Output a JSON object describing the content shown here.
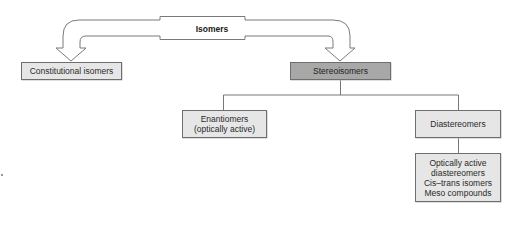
{
  "diagram": {
    "type": "hierarchy",
    "root": {
      "label": "Isomers"
    },
    "nodes": {
      "constitutional": {
        "label": "Constitutional isomers"
      },
      "stereoisomers": {
        "label": "Stereoisomers"
      },
      "enantiomers": {
        "lines": [
          "Enantiomers",
          "(optically active)"
        ]
      },
      "diastereomers": {
        "label": "Diastereomers"
      },
      "diastereomer_types": {
        "lines": [
          "Optically active",
          "diastereomers",
          "Cis–trans isomers",
          "Meso compounds"
        ]
      }
    },
    "edges": [
      {
        "from": "Isomers",
        "to": "Constitutional isomers",
        "style": "hollow-arrow"
      },
      {
        "from": "Isomers",
        "to": "Stereoisomers",
        "style": "hollow-arrow"
      },
      {
        "from": "Stereoisomers",
        "to": "Enantiomers (optically active)",
        "style": "line"
      },
      {
        "from": "Stereoisomers",
        "to": "Diastereomers",
        "style": "line"
      },
      {
        "from": "Diastereomers",
        "to": "Optically active diastereomers / Cis-trans isomers / Meso compounds",
        "style": "line"
      }
    ],
    "colors": {
      "box_fill": "#e6e6e6",
      "highlight_box_fill": "#a8a8a8",
      "stroke": "#6e6e6e",
      "text": "#2a2a2a"
    }
  }
}
